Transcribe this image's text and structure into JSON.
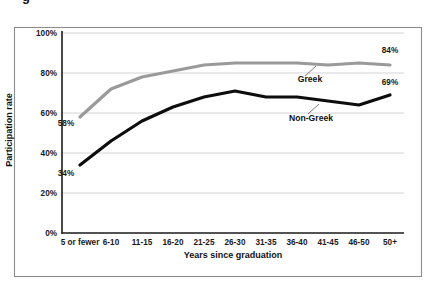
{
  "figure": {
    "cropped_title_fragment": "g",
    "frame_color": "#8d8d8d",
    "background": "#ffffff"
  },
  "chart_data": {
    "type": "line",
    "title": "",
    "xlabel": "Years since graduation",
    "ylabel": "Participation rate",
    "categories": [
      "5 or fewer",
      "6-10",
      "11-15",
      "16-20",
      "21-25",
      "26-30",
      "31-35",
      "36-40",
      "41-45",
      "46-50",
      "50+"
    ],
    "ylim": [
      0,
      100
    ],
    "ytick_labels": [
      "100%",
      "80%",
      "60%",
      "40%",
      "20%",
      "0%"
    ],
    "ytick_values": [
      100,
      80,
      60,
      40,
      20,
      0
    ],
    "grid": true,
    "grid_axis": "y",
    "legend_position": "inline-annotation",
    "series": [
      {
        "name": "Greek",
        "color": "#9a9a9a",
        "line_width": 3.2,
        "values": [
          58,
          72,
          78,
          81,
          84,
          85,
          85,
          85,
          84,
          85,
          84
        ],
        "label_position": {
          "x": 310,
          "y": 82
        },
        "leader_from": {
          "x": 305,
          "y": 76
        },
        "leader_to": {
          "x": 316,
          "y": 66
        }
      },
      {
        "name": "Non-Greek",
        "color": "#0d0d0d",
        "line_width": 3.2,
        "values": [
          34,
          46,
          56,
          63,
          68,
          71,
          68,
          68,
          66,
          64,
          69
        ],
        "label_position": {
          "x": 311,
          "y": 121
        },
        "leader_from": {
          "x": 308,
          "y": 114
        },
        "leader_to": {
          "x": 319,
          "y": 104
        }
      }
    ],
    "annotations": [
      {
        "text": "58%",
        "series": "Greek",
        "category": "5 or fewer",
        "value": 58,
        "x": 66,
        "y": 126
      },
      {
        "text": "84%",
        "series": "Greek",
        "category": "50+",
        "value": 84,
        "x": 390,
        "y": 53
      },
      {
        "text": "34%",
        "series": "Non-Greek",
        "category": "5 or fewer",
        "value": 34,
        "x": 66,
        "y": 176
      },
      {
        "text": "69%",
        "series": "Non-Greek",
        "category": "50+",
        "value": 69,
        "x": 390,
        "y": 85
      }
    ]
  }
}
